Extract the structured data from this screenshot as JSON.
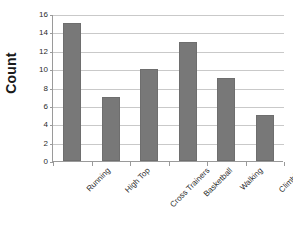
{
  "chart_data": {
    "type": "bar",
    "title": "",
    "subtitle": "",
    "xlabel": "",
    "ylabel": "Count",
    "categories": [
      "Running",
      "High Top",
      "Cross Trainers",
      "Basketball",
      "Walking",
      "Climbing"
    ],
    "values": [
      15,
      7,
      10,
      13,
      9,
      5
    ],
    "series": [
      {
        "name": "Count",
        "values": [
          15,
          7,
          10,
          13,
          9,
          5
        ]
      }
    ],
    "ylim": [
      0,
      16
    ],
    "ytick_step": 2,
    "ytick_labels": [
      "0",
      "2",
      "4",
      "6",
      "8",
      "10",
      "12",
      "14",
      "16"
    ],
    "grid": "horizontal",
    "legend": "none",
    "annotations": [],
    "colors": {
      "bar_fill": "#787878",
      "bar_border": "#6e6e6e",
      "gridline": "#c9c9c9",
      "axis_line": "#9a9a9a",
      "text": "#2b2b2b",
      "axis_title": "#1a1a1a",
      "background": "#ffffff"
    }
  }
}
